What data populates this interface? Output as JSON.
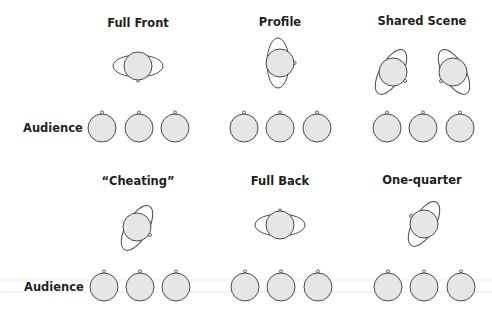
{
  "diagram": {
    "audience_label": "Audience",
    "colors": {
      "head_fill": "#e6e6e6",
      "outline": "#4a4a4a",
      "text": "#1f1f1f"
    },
    "panels": [
      {
        "id": "full-front",
        "title": "Full Front",
        "actors": [
          {
            "facing": "audience",
            "body_orientation": "horizontal"
          }
        ]
      },
      {
        "id": "profile",
        "title": "Profile",
        "actors": [
          {
            "facing": "stage-right",
            "body_orientation": "vertical"
          }
        ]
      },
      {
        "id": "shared-scene",
        "title": "Shared Scene",
        "actors": [
          {
            "facing": "partner-right, open to audience",
            "body_orientation": "diagonal"
          },
          {
            "facing": "partner-left, open to audience",
            "body_orientation": "diagonal"
          }
        ]
      },
      {
        "id": "cheating",
        "title": "“Cheating”",
        "actors": [
          {
            "facing": "three-quarter toward audience",
            "body_orientation": "diagonal"
          }
        ]
      },
      {
        "id": "full-back",
        "title": "Full Back",
        "actors": [
          {
            "facing": "upstage",
            "body_orientation": "horizontal"
          }
        ]
      },
      {
        "id": "one-quarter",
        "title": "One-quarter",
        "actors": [
          {
            "facing": "one-quarter away from audience",
            "body_orientation": "diagonal"
          }
        ]
      }
    ],
    "audience_rows": [
      {
        "label": "Audience",
        "members_per_panel": 3
      },
      {
        "label": "Audience",
        "members_per_panel": 3
      }
    ]
  }
}
